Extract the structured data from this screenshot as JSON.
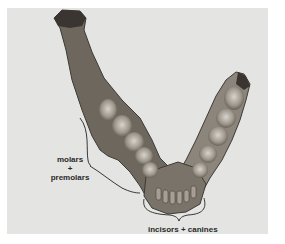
{
  "figure": {
    "background_color": "#e4e4e2",
    "annotations": {
      "molars_premolars": {
        "line1": "molars",
        "line2": "+",
        "line3": "premolars"
      },
      "incisors_canines": {
        "text": "incisors + canines"
      }
    }
  }
}
